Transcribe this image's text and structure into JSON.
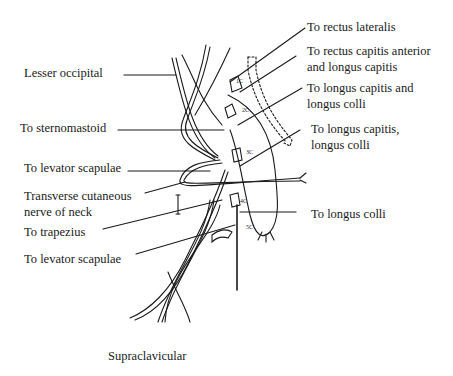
{
  "diagram": {
    "labels_left": [
      {
        "id": "lesser-occipital",
        "text": "Lesser occipital",
        "x": 24,
        "y": 65
      },
      {
        "id": "to-sternomastoid",
        "text": "To sternomastoid",
        "x": 20,
        "y": 120
      },
      {
        "id": "to-levator-scapulae-1",
        "text": "To levator scapulae",
        "x": 24,
        "y": 160
      },
      {
        "id": "transverse-cutaneous",
        "text": "Transverse cutaneous\nnerve of neck",
        "x": 24,
        "y": 188
      },
      {
        "id": "to-trapezius",
        "text": "To trapezius",
        "x": 24,
        "y": 224
      },
      {
        "id": "to-levator-scapulae-2",
        "text": "To levator scapulae",
        "x": 24,
        "y": 251
      }
    ],
    "labels_right": [
      {
        "id": "to-rectus-lateralis",
        "text": "To rectus lateralis",
        "x": 307,
        "y": 19
      },
      {
        "id": "to-rectus-capitis-anterior",
        "text": "To rectus capitis anterior\nand longus capitis",
        "x": 307,
        "y": 43
      },
      {
        "id": "to-longus-capitis-and-colli",
        "text": "To longus capitis and\nlongus colli",
        "x": 307,
        "y": 80
      },
      {
        "id": "to-longus-capitis-colli",
        "text": "To longus capitis,\nlongus colli",
        "x": 311,
        "y": 121
      },
      {
        "id": "to-longus-colli",
        "text": "To longus colli",
        "x": 311,
        "y": 206
      }
    ],
    "labels_bottom": [
      {
        "id": "supraclavicular",
        "text": "Supraclavicular",
        "x": 108,
        "y": 348
      }
    ],
    "vertebra_labels": [
      "1C",
      "2C",
      "3C",
      "4C",
      "5C"
    ]
  }
}
